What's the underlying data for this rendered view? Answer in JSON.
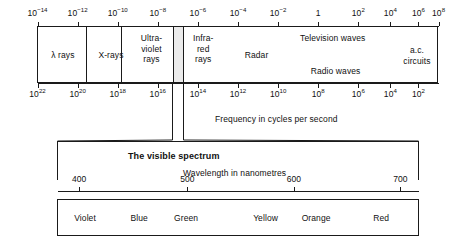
{
  "figure": {
    "ink_color": "#1a1a1a",
    "band_highlight_color": "#ebebeb",
    "background": "#ffffff"
  },
  "wavelength_axis": {
    "label": "",
    "unit_note": "metres",
    "ticks": [
      {
        "mantissa": "10",
        "exponent": "−14",
        "pos": 0.0
      },
      {
        "mantissa": "10",
        "exponent": "−12",
        "pos": 0.1
      },
      {
        "mantissa": "10",
        "exponent": "−10",
        "pos": 0.2
      },
      {
        "mantissa": "10",
        "exponent": "−8",
        "pos": 0.3
      },
      {
        "mantissa": "10",
        "exponent": "−6",
        "pos": 0.4
      },
      {
        "mantissa": "10",
        "exponent": "−4",
        "pos": 0.5
      },
      {
        "mantissa": "10",
        "exponent": "−2",
        "pos": 0.6
      },
      {
        "mantissa": "1",
        "exponent": "",
        "pos": 0.7
      },
      {
        "mantissa": "10",
        "exponent": "2",
        "pos": 0.8
      },
      {
        "mantissa": "10",
        "exponent": "4",
        "pos": 0.88
      },
      {
        "mantissa": "10",
        "exponent": "6",
        "pos": 0.95
      },
      {
        "mantissa": "10",
        "exponent": "8",
        "pos": 1.0
      }
    ]
  },
  "frequency_axis": {
    "label": "Frequency in cycles per second",
    "ticks": [
      {
        "mantissa": "10",
        "exponent": "22",
        "pos": 0.0
      },
      {
        "mantissa": "10",
        "exponent": "20",
        "pos": 0.1
      },
      {
        "mantissa": "10",
        "exponent": "18",
        "pos": 0.2
      },
      {
        "mantissa": "10",
        "exponent": "16",
        "pos": 0.3
      },
      {
        "mantissa": "10",
        "exponent": "14",
        "pos": 0.4
      },
      {
        "mantissa": "10",
        "exponent": "12",
        "pos": 0.5
      },
      {
        "mantissa": "10",
        "exponent": "10",
        "pos": 0.6
      },
      {
        "mantissa": "10",
        "exponent": "8",
        "pos": 0.7
      },
      {
        "mantissa": "10",
        "exponent": "6",
        "pos": 0.8
      },
      {
        "mantissa": "10",
        "exponent": "4",
        "pos": 0.88
      },
      {
        "mantissa": "10",
        "exponent": "2",
        "pos": 0.95
      }
    ]
  },
  "em_bands": [
    {
      "name": "gamma-rays",
      "label": "λ rays",
      "center": 0.062,
      "align": "center",
      "valign": "middle"
    },
    {
      "name": "x-rays",
      "label": "X-rays",
      "center": 0.182,
      "align": "center",
      "valign": "middle"
    },
    {
      "name": "ultraviolet-rays",
      "label": "Ultra-\nviolet\nrays",
      "center": 0.283,
      "align": "center",
      "valign": "top"
    },
    {
      "name": "visible-band",
      "label": "",
      "center": 0.357,
      "align": "center",
      "valign": "middle"
    },
    {
      "name": "infrared-rays",
      "label": "Infra-\nred\nrays",
      "center": 0.412,
      "align": "center",
      "valign": "top"
    },
    {
      "name": "radar",
      "label": "Radar",
      "center": 0.545,
      "align": "center",
      "valign": "middle"
    },
    {
      "name": "television-waves",
      "label": "Television waves",
      "center": 0.735,
      "align": "center",
      "valign": "top"
    },
    {
      "name": "radio-waves",
      "label": "Radio waves",
      "center": 0.742,
      "align": "center",
      "valign": "bottom"
    },
    {
      "name": "ac-circuits",
      "label": "a.c.\ncircuits",
      "center": 0.945,
      "align": "center",
      "valign": "middle"
    }
  ],
  "visible_spectrum": {
    "title": "The visible spectrum",
    "axis_label": "Wavelength in nanometres",
    "nm_ticks": [
      {
        "label": "400",
        "pos": 0.06
      },
      {
        "label": "500",
        "pos": 0.36
      },
      {
        "label": "600",
        "pos": 0.655
      },
      {
        "label": "700",
        "pos": 0.95
      }
    ],
    "colors": [
      {
        "label": "Violet",
        "pos": 0.075
      },
      {
        "label": "Blue",
        "pos": 0.225
      },
      {
        "label": "Green",
        "pos": 0.355
      },
      {
        "label": "Yellow",
        "pos": 0.575
      },
      {
        "label": "Orange",
        "pos": 0.715
      },
      {
        "label": "Red",
        "pos": 0.895
      }
    ]
  }
}
